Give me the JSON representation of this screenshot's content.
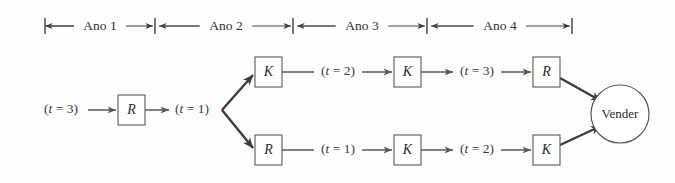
{
  "figure": {
    "background_color": "#fdfdfd",
    "line_color": "#59595b",
    "text_color": "#2b2b2b"
  },
  "timeline": {
    "name": "year-scale",
    "segments": [
      {
        "label": "Ano 1",
        "x_start": 45,
        "x_end": 155
      },
      {
        "label": "Ano 2",
        "x_start": 155,
        "x_end": 293
      },
      {
        "label": "Ano 3",
        "x_start": 293,
        "x_end": 427
      },
      {
        "label": "Ano 4",
        "x_start": 427,
        "x_end": 572
      }
    ],
    "y": 26
  },
  "nodes": [
    {
      "id": "n-root-r",
      "label": "R",
      "shape": "square",
      "x": 118,
      "y": 95,
      "w": 27,
      "h": 30
    },
    {
      "id": "n-up-k1",
      "label": "K",
      "shape": "square",
      "x": 255,
      "y": 57,
      "w": 27,
      "h": 30
    },
    {
      "id": "n-up-k2",
      "label": "K",
      "shape": "square",
      "x": 394,
      "y": 57,
      "w": 27,
      "h": 30
    },
    {
      "id": "n-up-r",
      "label": "R",
      "shape": "square",
      "x": 533,
      "y": 57,
      "w": 27,
      "h": 30
    },
    {
      "id": "n-low-r",
      "label": "R",
      "shape": "square",
      "x": 255,
      "y": 135,
      "w": 27,
      "h": 30
    },
    {
      "id": "n-low-k1",
      "label": "K",
      "shape": "square",
      "x": 394,
      "y": 135,
      "w": 27,
      "h": 30
    },
    {
      "id": "n-low-k2",
      "label": "K",
      "shape": "square",
      "x": 533,
      "y": 135,
      "w": 27,
      "h": 30
    },
    {
      "id": "n-vender",
      "label": "Vender",
      "shape": "circle",
      "cx": 620,
      "cy": 114,
      "r": 29
    }
  ],
  "edge_labels": [
    {
      "id": "lbl-start",
      "text": "(t = 3)",
      "x": 61,
      "y": 110
    },
    {
      "id": "lbl-branch",
      "text": "(t = 1)",
      "x": 190,
      "y": 110
    },
    {
      "id": "lbl-up-1",
      "text": "(t = 2)",
      "x": 338,
      "y": 72
    },
    {
      "id": "lbl-up-2",
      "text": "(t = 3)",
      "x": 477,
      "y": 72
    },
    {
      "id": "lbl-low-1",
      "text": "(t = 1)",
      "x": 338,
      "y": 150
    },
    {
      "id": "lbl-low-2",
      "text": "(t = 2)",
      "x": 477,
      "y": 150
    }
  ],
  "edge_label_parts": {
    "var": "t",
    "eq": " = ",
    "open": "(",
    "close": ")",
    "values": {
      "start": "3",
      "branch": "1",
      "up1": "2",
      "up2": "3",
      "low1": "1",
      "low2": "2"
    }
  },
  "branch_point": {
    "x": 222,
    "y": 110
  }
}
